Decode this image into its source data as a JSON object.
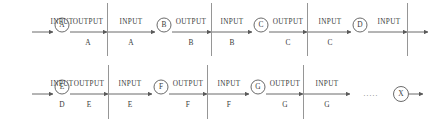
{
  "diagram": {
    "colors": {
      "line": "#5a5a5a",
      "divider": "#8a8a8a",
      "text": "#3a3a3a",
      "background": "#ffffff"
    },
    "rows": [
      {
        "id": "row-1",
        "segments": [
          {
            "in_label": "INPUT",
            "in_sub": "",
            "node": "A",
            "out_label": "OUTPUT",
            "out_sub": "A"
          },
          {
            "in_label": "INPUT",
            "in_sub": "A",
            "node": "B",
            "out_label": "OUTPUT",
            "out_sub": "B"
          },
          {
            "in_label": "INPUT",
            "in_sub": "B",
            "node": "C",
            "out_label": "OUTPUT",
            "out_sub": "C"
          },
          {
            "in_label": "INPUT",
            "in_sub": "C",
            "node": "D",
            "out_label": "INPUT",
            "out_sub": ""
          }
        ]
      },
      {
        "id": "row-2",
        "segments": [
          {
            "in_label": "INPUT",
            "in_sub": "D",
            "node": "E",
            "out_label": "OUTPUT",
            "out_sub": "E"
          },
          {
            "in_label": "INPUT",
            "in_sub": "E",
            "node": "F",
            "out_label": "OUTPUT",
            "out_sub": "F"
          },
          {
            "in_label": "INPUT",
            "in_sub": "F",
            "node": "G",
            "out_label": "OUTPUT",
            "out_sub": "G"
          },
          {
            "in_label": "INPUT",
            "in_sub": "G",
            "node": "",
            "out_label": "",
            "out_sub": ""
          }
        ],
        "ellipsis": ".....",
        "terminal_node": "X"
      }
    ]
  }
}
